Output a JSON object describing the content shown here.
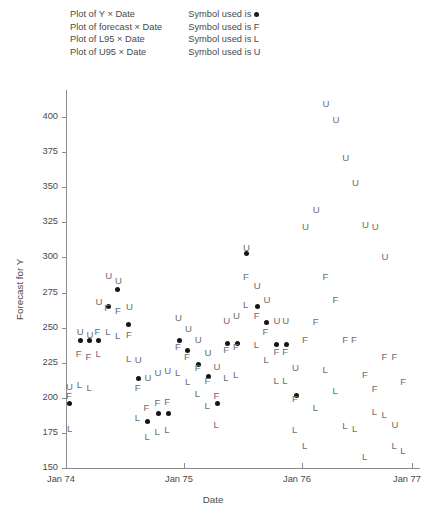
{
  "legend": {
    "plots": [
      "Plot of Y × Date",
      "Plot of forecast × Date",
      "Plot of L95 × Date",
      "Plot of U95 × Date"
    ],
    "symbols": [
      "Symbol used is",
      "Symbol used is F",
      "Symbol used is L",
      "Symbol used is U"
    ]
  },
  "chart_data": {
    "type": "scatter",
    "title": "",
    "xlabel": "Date",
    "ylabel": "Forecast for Y",
    "ylim": [
      150,
      415
    ],
    "yticks": [
      150,
      175,
      200,
      225,
      250,
      275,
      300,
      325,
      350,
      375,
      400
    ],
    "xticks": [
      "Jan 74",
      "Jan 75",
      "Jan 76",
      "Jan 77"
    ],
    "xlim": [
      0,
      36
    ],
    "grid": false,
    "legend_position": "top",
    "marker_colors": {
      "observed": "#151515",
      "forecast": "#6e6e6e",
      "lower": "#6e6e6e",
      "upper": "#6e6e6e"
    },
    "series": [
      {
        "name": "Y",
        "symbol": "dot",
        "points": [
          [
            0.4,
            196
          ],
          [
            1.5,
            241
          ],
          [
            2.4,
            241
          ],
          [
            3.3,
            241
          ],
          [
            4.3,
            265
          ],
          [
            5.2,
            277
          ],
          [
            6.4,
            252
          ],
          [
            7.4,
            214
          ],
          [
            8.3,
            183
          ],
          [
            9.4,
            189
          ],
          [
            10.4,
            189
          ],
          [
            11.5,
            241
          ],
          [
            12.4,
            234
          ],
          [
            13.5,
            224
          ],
          [
            14.5,
            215
          ],
          [
            15.4,
            196
          ],
          [
            16.4,
            239
          ],
          [
            17.4,
            239
          ],
          [
            18.4,
            303
          ],
          [
            19.5,
            265
          ],
          [
            20.4,
            254
          ],
          [
            21.4,
            238
          ],
          [
            22.4,
            238
          ],
          [
            23.4,
            202
          ]
        ]
      },
      {
        "name": "forecast",
        "symbol": "F",
        "points": [
          [
            0.3,
            201
          ],
          [
            1.3,
            231
          ],
          [
            2.3,
            229
          ],
          [
            3.2,
            247
          ],
          [
            4.2,
            264
          ],
          [
            5.3,
            262
          ],
          [
            6.4,
            245
          ],
          [
            7.3,
            207
          ],
          [
            8.2,
            193
          ],
          [
            9.3,
            196
          ],
          [
            10.3,
            197
          ],
          [
            11.4,
            236
          ],
          [
            12.3,
            229
          ],
          [
            13.4,
            221
          ],
          [
            14.4,
            212
          ],
          [
            15.3,
            201
          ],
          [
            16.3,
            234
          ],
          [
            17.3,
            236
          ],
          [
            18.3,
            286
          ],
          [
            19.4,
            258
          ],
          [
            20.3,
            247
          ],
          [
            21.4,
            233
          ],
          [
            22.3,
            233
          ],
          [
            23.3,
            199
          ],
          [
            24.3,
            241
          ],
          [
            25.4,
            254
          ],
          [
            26.4,
            286
          ],
          [
            27.4,
            270
          ],
          [
            28.4,
            241
          ],
          [
            29.3,
            241
          ],
          [
            30.4,
            216
          ],
          [
            31.4,
            206
          ],
          [
            32.4,
            229
          ],
          [
            33.4,
            229
          ],
          [
            34.3,
            211
          ]
        ]
      },
      {
        "name": "L95",
        "symbol": "L",
        "points": [
          [
            0.4,
            178
          ],
          [
            1.4,
            209
          ],
          [
            2.4,
            207
          ],
          [
            3.3,
            231
          ],
          [
            4.3,
            247
          ],
          [
            5.3,
            244
          ],
          [
            6.4,
            228
          ],
          [
            7.3,
            186
          ],
          [
            8.3,
            172
          ],
          [
            9.3,
            176
          ],
          [
            10.3,
            177
          ],
          [
            11.4,
            218
          ],
          [
            12.4,
            211
          ],
          [
            13.4,
            203
          ],
          [
            14.4,
            194
          ],
          [
            15.3,
            181
          ],
          [
            16.3,
            214
          ],
          [
            17.3,
            216
          ],
          [
            18.3,
            266
          ],
          [
            19.4,
            238
          ],
          [
            20.4,
            227
          ],
          [
            21.4,
            212
          ],
          [
            22.3,
            212
          ],
          [
            23.3,
            177
          ],
          [
            24.3,
            166
          ],
          [
            25.4,
            193
          ],
          [
            26.4,
            220
          ],
          [
            27.4,
            205
          ],
          [
            28.4,
            180
          ],
          [
            29.4,
            178
          ],
          [
            30.4,
            158
          ],
          [
            31.4,
            190
          ],
          [
            32.4,
            188
          ],
          [
            33.4,
            166
          ],
          [
            34.3,
            162
          ]
        ]
      },
      {
        "name": "U95",
        "symbol": "U",
        "points": [
          [
            0.3,
            208
          ],
          [
            1.4,
            247
          ],
          [
            2.4,
            245
          ],
          [
            3.3,
            268
          ],
          [
            4.3,
            287
          ],
          [
            5.3,
            283
          ],
          [
            6.4,
            265
          ],
          [
            7.3,
            227
          ],
          [
            8.3,
            214
          ],
          [
            9.3,
            218
          ],
          [
            10.3,
            219
          ],
          [
            11.4,
            257
          ],
          [
            12.4,
            249
          ],
          [
            13.4,
            241
          ],
          [
            14.4,
            232
          ],
          [
            15.3,
            222
          ],
          [
            16.3,
            255
          ],
          [
            17.3,
            258
          ],
          [
            18.3,
            307
          ],
          [
            19.4,
            280
          ],
          [
            20.4,
            270
          ],
          [
            21.4,
            255
          ],
          [
            22.3,
            255
          ],
          [
            23.3,
            221
          ],
          [
            24.3,
            322
          ],
          [
            25.4,
            334
          ],
          [
            26.4,
            409
          ],
          [
            27.4,
            398
          ],
          [
            28.4,
            371
          ],
          [
            29.4,
            353
          ],
          [
            30.4,
            323
          ],
          [
            31.4,
            322
          ],
          [
            32.4,
            300
          ],
          [
            33.4,
            181
          ]
        ]
      }
    ]
  }
}
